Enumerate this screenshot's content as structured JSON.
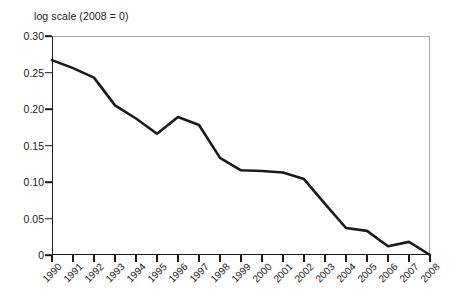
{
  "chart_data": {
    "type": "line",
    "title": "log scale (2008 = 0)",
    "xlabel": "",
    "ylabel": "",
    "grid": false,
    "legend": "none",
    "xlim": [
      1990,
      2008
    ],
    "ylim": [
      0,
      0.3
    ],
    "ytick_labels": [
      "0.30",
      "0.25",
      "0.20",
      "0.15",
      "0.10",
      "0.05",
      "0"
    ],
    "ytick_values": [
      0.3,
      0.25,
      0.2,
      0.15,
      0.1,
      0.05,
      0
    ],
    "categories": [
      "1990",
      "1991",
      "1992",
      "1993",
      "1994",
      "1995",
      "1996",
      "1997",
      "1998",
      "1999",
      "2000",
      "2001",
      "2002",
      "2003",
      "2004",
      "2005",
      "2006",
      "2007",
      "2008"
    ],
    "x": [
      1990,
      1991,
      1992,
      1993,
      1994,
      1995,
      1996,
      1997,
      1998,
      1999,
      2000,
      2001,
      2002,
      2003,
      2004,
      2005,
      2006,
      2007,
      2008
    ],
    "values": [
      0.267,
      0.256,
      0.243,
      0.205,
      0.187,
      0.166,
      0.189,
      0.178,
      0.133,
      0.116,
      0.115,
      0.113,
      0.104,
      0.07,
      0.037,
      0.033,
      0.012,
      0.018,
      0.0
    ],
    "series": [
      {
        "name": "log scale (2008 = 0)",
        "color": "#1a1a1a",
        "values": [
          0.267,
          0.256,
          0.243,
          0.205,
          0.187,
          0.166,
          0.189,
          0.178,
          0.133,
          0.116,
          0.115,
          0.113,
          0.104,
          0.07,
          0.037,
          0.033,
          0.012,
          0.018,
          0.0
        ]
      }
    ]
  },
  "colors": {
    "line": "#1a1a1a",
    "axis": "#1a1a1a",
    "frame": "#a9a9a9",
    "background": "#ffffff"
  }
}
